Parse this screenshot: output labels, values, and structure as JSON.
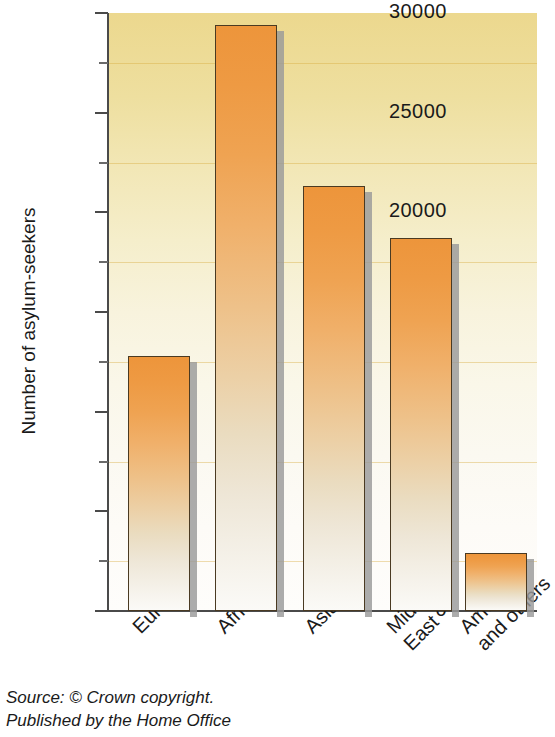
{
  "chart_data": {
    "type": "bar",
    "title": "",
    "xlabel": "",
    "ylabel": "Number of asylum-seekers",
    "categories": [
      "Europe",
      "Africa",
      "Asia",
      "Middle East",
      "America and others"
    ],
    "category_lines": [
      [
        "Europe"
      ],
      [
        "Africa"
      ],
      [
        "Asia"
      ],
      [
        "Middle",
        "East"
      ],
      [
        "America",
        "and others"
      ]
    ],
    "values": [
      12800,
      29400,
      21300,
      18700,
      2900
    ],
    "ylim": [
      0,
      30000
    ],
    "ytick_labels": [
      "0",
      "5000",
      "10000",
      "15000",
      "20000",
      "25000",
      "30000"
    ],
    "ytick_values": [
      0,
      5000,
      10000,
      15000,
      20000,
      25000,
      30000
    ],
    "minor_tick_values": [
      2500,
      7500,
      12500,
      17500,
      22500,
      27500
    ],
    "grid": true,
    "legend": "none",
    "colors": {
      "bar_top": "#ed953b",
      "bar_bottom": "#fbfaf7",
      "bar_outline": "#4a3a22",
      "plot_bg_top": "#ecd88e",
      "plot_bg_bottom": "#fefdfb",
      "gridline": "#d8aa3c",
      "axis": "#4a4a4a",
      "shadow": "#9a9a9a"
    }
  },
  "source": {
    "line1": "Source: © Crown copyright.",
    "line2": "Published by the Home Office"
  }
}
